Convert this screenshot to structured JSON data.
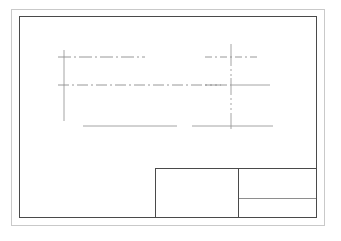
{
  "sheet": {
    "background_color": "#ffffff",
    "outer_frame": {
      "label": "trim-frame",
      "color": "#c9c9c9",
      "x": 11,
      "y": 9,
      "width": 314,
      "height": 217
    },
    "inner_frame": {
      "label": "drawing-border",
      "color": "#4a4a4a",
      "x": 19,
      "y": 16,
      "width": 298,
      "height": 202
    }
  },
  "title_block": {
    "label": "title-block",
    "border_color": "#4a4a4a",
    "divider_color": "#8e8e8e",
    "x": 155,
    "y": 168,
    "width": 162,
    "height": 50,
    "main_cell": {
      "label": "title-field",
      "text": ""
    },
    "top_right_cell": {
      "label": "drawing-number-field",
      "text": ""
    },
    "bottom_right_cell": {
      "label": "scale-field",
      "text": ""
    }
  },
  "geometry": {
    "line_color_solid": "#8c8c8c",
    "line_color_center": "#8c8c8c",
    "left_view": {
      "label": "left-view",
      "vertical_axis": {
        "label": "left-vertical-edge",
        "x": 44,
        "y1": 33,
        "y2": 104,
        "style": "solid"
      },
      "center_line_upper": {
        "label": "upper-centerline",
        "y": 40,
        "x1": 38,
        "x2": 125,
        "style": "dash-dot"
      },
      "center_line_middle": {
        "label": "middle-centerline",
        "y": 68,
        "x1": 38,
        "x2": 202,
        "style": "dash-dot"
      },
      "base_line": {
        "label": "base-line",
        "y": 109,
        "x1": 63,
        "x2": 157,
        "style": "solid"
      }
    },
    "right_view": {
      "label": "right-view",
      "vertical_axis": {
        "label": "right-centerline",
        "x": 211,
        "y1": 27,
        "y2": 108,
        "style": "center"
      },
      "center_line_upper": {
        "label": "upper-centerline",
        "y": 40,
        "x1": 185,
        "x2": 238,
        "style": "dash-dot"
      },
      "center_line_middle": {
        "label": "middle-centerline",
        "y": 68,
        "x1": 185,
        "x2": 250,
        "style": "dash-dot-solid"
      },
      "base_line": {
        "label": "base-line",
        "y": 109,
        "x1": 172,
        "x2": 253,
        "style": "solid"
      }
    }
  }
}
